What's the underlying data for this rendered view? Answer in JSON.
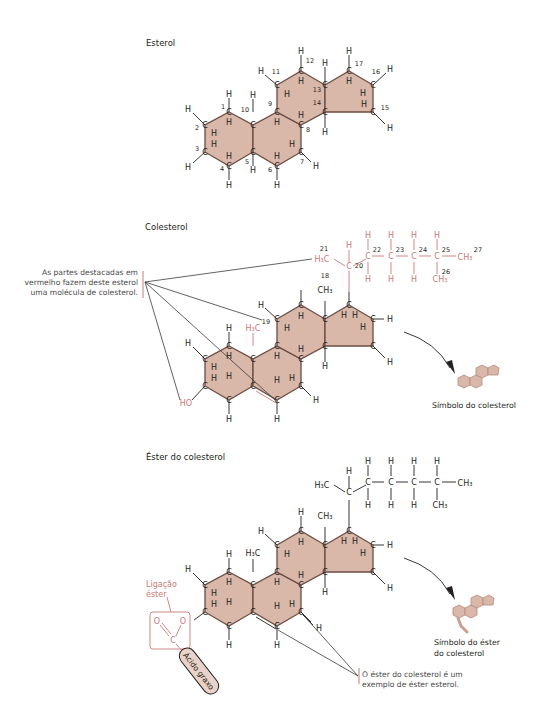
{
  "sections": {
    "sterol": {
      "title": "Esterol",
      "carbon_numbers": [
        "1",
        "2",
        "3",
        "4",
        "5",
        "6",
        "7",
        "8",
        "9",
        "10",
        "11",
        "12",
        "13",
        "14",
        "15",
        "16",
        "17"
      ]
    },
    "cholesterol": {
      "title": "Colesterol",
      "note": "As partes destacadas em vermelho fazem deste esterol uma molécula de colesterol.",
      "note_lines": [
        "As partes destacadas em",
        "vermelho fazem deste esterol",
        "uma molécula de colesterol."
      ],
      "hydroxyl_label": "HO",
      "methyl_19_label": "H3C",
      "carbon_numbers": [
        "18",
        "19",
        "20",
        "21",
        "22",
        "23",
        "24",
        "25",
        "26",
        "27"
      ],
      "symbol_caption": "Símbolo do colesterol"
    },
    "cholesterol_ester": {
      "title": "Éster do colesterol",
      "ester_bond_label_lines": [
        "Ligação",
        "éster"
      ],
      "fatty_acid_label": "Ácido graxo",
      "note_lines": [
        "O éster do colesterol é um",
        "exemplo de éster esterol."
      ],
      "symbol_caption_lines": [
        "Símbolo do éster",
        "do colesterol"
      ]
    }
  },
  "colors": {
    "ring_fill": "#d9b8aa",
    "ring_stroke": "#6b4b42",
    "highlight_red": "#c97a78",
    "text": "#231f20"
  }
}
